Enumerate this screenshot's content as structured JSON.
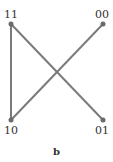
{
  "diagram": {
    "caption": "b",
    "edge_color": "#7a7a7a",
    "nodes": [
      {
        "id": "11",
        "label": "11",
        "x": 11,
        "y": 24
      },
      {
        "id": "00",
        "label": "00",
        "x": 103,
        "y": 24
      },
      {
        "id": "10",
        "label": "10",
        "x": 11,
        "y": 120
      },
      {
        "id": "01",
        "label": "01",
        "x": 103,
        "y": 120
      }
    ],
    "edges": [
      {
        "from": "11",
        "to": "10"
      },
      {
        "from": "11",
        "to": "01"
      },
      {
        "from": "10",
        "to": "00"
      }
    ]
  }
}
